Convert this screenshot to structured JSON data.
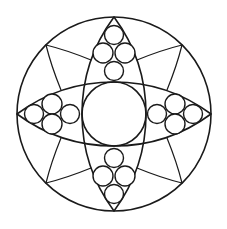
{
  "figure": {
    "canvas": {
      "width": 227,
      "height": 229,
      "background": "#ffffff"
    },
    "stroke_color": "#1a1a1a",
    "outer_circle": {
      "cx": 114,
      "cy": 114,
      "r": 97
    },
    "center_circle": {
      "cx": 114,
      "cy": 114,
      "r": 32
    },
    "lenses": [
      {
        "name": "vertical-lens",
        "tip_a": [
          114,
          17
        ],
        "tip_b": [
          114,
          211
        ],
        "arc_radius": 163
      },
      {
        "name": "horizontal-lens",
        "tip_a": [
          17,
          114
        ],
        "tip_b": [
          211,
          114
        ],
        "arc_radius": 163
      }
    ],
    "bead_clusters": [
      {
        "name": "top-cluster",
        "circles": [
          {
            "cx": 114,
            "cy": 35,
            "r": 9.5
          },
          {
            "cx": 103,
            "cy": 53,
            "r": 10
          },
          {
            "cx": 125,
            "cy": 53,
            "r": 10
          },
          {
            "cx": 114,
            "cy": 71,
            "r": 9.5
          }
        ]
      },
      {
        "name": "bottom-cluster",
        "circles": [
          {
            "cx": 114,
            "cy": 158,
            "r": 9.5
          },
          {
            "cx": 103,
            "cy": 176,
            "r": 10
          },
          {
            "cx": 125,
            "cy": 176,
            "r": 10
          },
          {
            "cx": 114,
            "cy": 194,
            "r": 9.5
          }
        ]
      },
      {
        "name": "left-cluster",
        "circles": [
          {
            "cx": 34,
            "cy": 114,
            "r": 9.5
          },
          {
            "cx": 52,
            "cy": 104,
            "r": 10
          },
          {
            "cx": 52,
            "cy": 124,
            "r": 10
          },
          {
            "cx": 70,
            "cy": 114,
            "r": 9.5
          }
        ]
      },
      {
        "name": "right-cluster",
        "circles": [
          {
            "cx": 157,
            "cy": 114,
            "r": 9.5
          },
          {
            "cx": 175,
            "cy": 104,
            "r": 10
          },
          {
            "cx": 175,
            "cy": 124,
            "r": 10
          },
          {
            "cx": 193,
            "cy": 114,
            "r": 9.5
          }
        ]
      }
    ],
    "petal_wedges": [
      {
        "name": "upper-left-wedge",
        "apex": [
          46,
          45
        ],
        "to_vertical_lens": [
          91,
          60
        ],
        "to_horizontal_lens": [
          61,
          90
        ]
      },
      {
        "name": "upper-right-wedge",
        "apex": [
          182,
          45
        ],
        "to_vertical_lens": [
          137,
          60
        ],
        "to_horizontal_lens": [
          167,
          90
        ]
      },
      {
        "name": "lower-left-wedge",
        "apex": [
          46,
          183
        ],
        "to_vertical_lens": [
          91,
          168
        ],
        "to_horizontal_lens": [
          61,
          138
        ]
      },
      {
        "name": "lower-right-wedge",
        "apex": [
          182,
          183
        ],
        "to_vertical_lens": [
          137,
          168
        ],
        "to_horizontal_lens": [
          167,
          138
        ]
      }
    ]
  }
}
